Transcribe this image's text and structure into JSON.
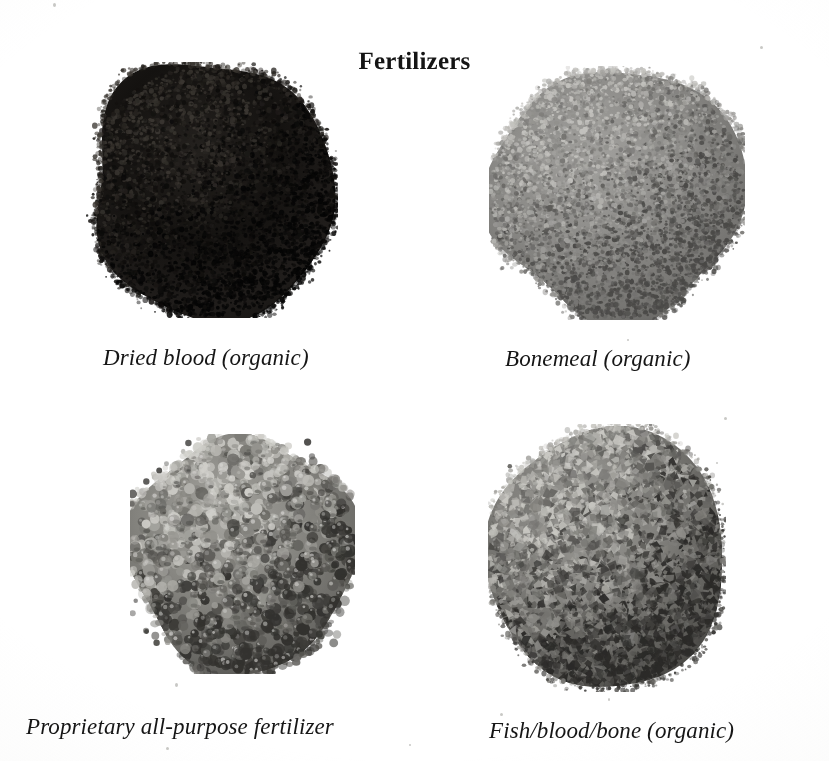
{
  "figure": {
    "title": "Fertilizers",
    "background_color": "#ffffff",
    "caption_color": "#161616",
    "title_color": "#141414"
  },
  "items": [
    {
      "id": "dried-blood",
      "caption": "Dried blood (organic)",
      "material": "dried blood",
      "texture": "fine granular powder",
      "tone": "very dark, near black",
      "colors": {
        "base": "#141210",
        "mid": "#24211e",
        "light": "#3a3631",
        "dark": "#050505"
      },
      "grain_size": "fine",
      "grain_count": 5200,
      "shape": "rounded heap",
      "position": {
        "x": 86,
        "y": 62,
        "width": 252,
        "height": 256
      }
    },
    {
      "id": "bonemeal",
      "caption": "Bonemeal (organic)",
      "material": "bonemeal",
      "texture": "fine dusty powder",
      "tone": "medium grey",
      "colors": {
        "base": "#8b8a87",
        "mid": "#6e6d6a",
        "light": "#c2c1bd",
        "dark": "#4a4947"
      },
      "grain_size": "fine",
      "grain_count": 5600,
      "shape": "rounded heap",
      "position": {
        "x": 489,
        "y": 66,
        "width": 256,
        "height": 254
      }
    },
    {
      "id": "proprietary-fertilizer",
      "caption": "Proprietary all-purpose fertilizer",
      "material": "proprietary all-purpose fertilizer",
      "texture": "coarse rounded prills",
      "tone": "mid grey with highlights",
      "colors": {
        "base": "#85847f",
        "mid": "#605f5b",
        "light": "#cfcec9",
        "dark": "#33322f"
      },
      "grain_size": "coarse",
      "grain_count": 1150,
      "shape": "rounded heap",
      "position": {
        "x": 130,
        "y": 434,
        "width": 225,
        "height": 240
      }
    },
    {
      "id": "fish-blood-bone",
      "caption": "Fish/blood/bone (organic)",
      "material": "fish/blood/bone",
      "texture": "angular flaky chips",
      "tone": "mid grey, high contrast",
      "colors": {
        "base": "#7e7d79",
        "mid": "#55544f",
        "light": "#c8c7c2",
        "dark": "#2b2a28"
      },
      "grain_size": "medium-coarse",
      "grain_count": 3400,
      "shape": "rounded heap",
      "position": {
        "x": 488,
        "y": 424,
        "width": 238,
        "height": 268
      }
    }
  ],
  "captions": {
    "dried_blood": "Dried blood (organic)",
    "bonemeal": "Bonemeal (organic)",
    "proprietary": "Proprietary all-purpose fertilizer",
    "fish_blood_bone": "Fish/blood/bone (organic)"
  },
  "caption_positions": [
    {
      "id": "dried-blood",
      "x": 103,
      "y": 345
    },
    {
      "id": "bonemeal",
      "x": 505,
      "y": 346
    },
    {
      "id": "proprietary-fertilizer",
      "x": 26,
      "y": 714
    },
    {
      "id": "fish-blood-bone",
      "x": 489,
      "y": 718
    }
  ],
  "specks": [
    {
      "x": 53,
      "y": 3,
      "w": 3,
      "h": 4
    },
    {
      "x": 404,
      "y": 55,
      "w": 2,
      "h": 2
    },
    {
      "x": 760,
      "y": 46,
      "w": 3,
      "h": 3
    },
    {
      "x": 175,
      "y": 683,
      "w": 3,
      "h": 4
    },
    {
      "x": 166,
      "y": 747,
      "w": 3,
      "h": 3
    },
    {
      "x": 500,
      "y": 713,
      "w": 3,
      "h": 3
    },
    {
      "x": 608,
      "y": 698,
      "w": 2,
      "h": 3
    },
    {
      "x": 724,
      "y": 417,
      "w": 3,
      "h": 3
    },
    {
      "x": 716,
      "y": 462,
      "w": 2,
      "h": 2
    },
    {
      "x": 409,
      "y": 744,
      "w": 2,
      "h": 2
    },
    {
      "x": 627,
      "y": 339,
      "w": 2,
      "h": 2
    }
  ]
}
